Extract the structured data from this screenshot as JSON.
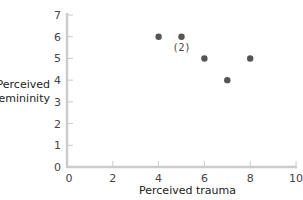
{
  "chart_data": {
    "type": "scatter",
    "title": "",
    "xlabel": "Perceived trauma",
    "ylabel_lines": [
      "Perceived",
      "femininity"
    ],
    "xlim": [
      0,
      10
    ],
    "ylim": [
      0,
      7
    ],
    "xticks": [
      0,
      2,
      4,
      6,
      8,
      10
    ],
    "yticks": [
      0,
      1,
      2,
      3,
      4,
      5,
      6,
      7
    ],
    "grid": false,
    "legend": null,
    "points": [
      {
        "x": 4,
        "y": 6
      },
      {
        "x": 5,
        "y": 6,
        "label": "(2)"
      },
      {
        "x": 6,
        "y": 5
      },
      {
        "x": 7,
        "y": 4
      },
      {
        "x": 8,
        "y": 5
      }
    ],
    "annotations": [
      {
        "text": "(2)",
        "x": 5,
        "y": 6,
        "note": "two participants share this point"
      }
    ],
    "colors": {
      "point": "#555555",
      "axis": "#cccccc",
      "text": "#444444"
    }
  }
}
